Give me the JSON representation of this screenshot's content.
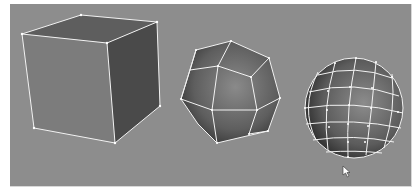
{
  "viewport": {
    "background": "#8d8d8d",
    "mode": "wireframe-on-shaded"
  },
  "objects": [
    {
      "name": "Cube",
      "type": "cube",
      "faces": 6
    },
    {
      "name": "Low-poly sphere",
      "type": "polysphere-low",
      "segments": 8
    },
    {
      "name": "Sphere",
      "type": "polysphere-high",
      "segments": 16
    }
  ],
  "cursor": {
    "icon": "arrow-cursor-icon",
    "x": 346,
    "y": 169
  }
}
